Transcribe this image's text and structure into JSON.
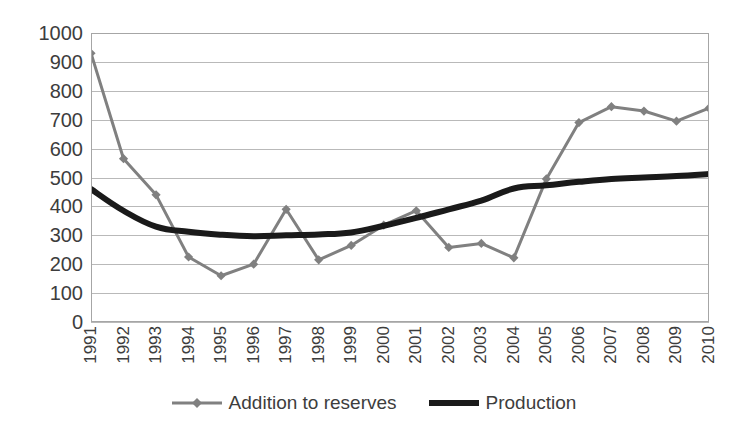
{
  "chart_data": {
    "type": "line",
    "title": "",
    "xlabel": "",
    "ylabel": "",
    "ylim": [
      0,
      1000
    ],
    "ytick_step": 100,
    "grid": "horizontal",
    "legend_position": "bottom-center",
    "categories": [
      "1991",
      "1992",
      "1993",
      "1994",
      "1995",
      "1996",
      "1997",
      "1998",
      "1999",
      "2000",
      "2001",
      "2002",
      "2003",
      "2004",
      "2005",
      "2006",
      "2007",
      "2008",
      "2009",
      "2010"
    ],
    "ytick_labels": [
      "1000",
      "900",
      "800",
      "700",
      "600",
      "500",
      "400",
      "300",
      "200",
      "100",
      "0"
    ],
    "series": [
      {
        "name": "Addition to reserves",
        "color": "#808080",
        "marker": "diamond",
        "line_width": 3,
        "values": [
          930,
          565,
          440,
          225,
          160,
          200,
          390,
          215,
          265,
          335,
          385,
          258,
          272,
          222,
          495,
          690,
          745,
          730,
          695,
          740
        ]
      },
      {
        "name": "Production",
        "color": "#1a1a1a",
        "marker": "none",
        "line_width": 6,
        "smooth": true,
        "values": [
          460,
          385,
          330,
          312,
          302,
          297,
          300,
          303,
          310,
          333,
          360,
          390,
          420,
          462,
          473,
          485,
          495,
          500,
          505,
          512
        ]
      }
    ]
  },
  "axis": {
    "y_min": 0,
    "y_max": 1000
  },
  "colors": {
    "series_addition": "#808080",
    "series_production": "#1a1a1a",
    "gridline": "#b9b9b9",
    "plot_border": "#a6a6a6",
    "text": "#3d3d3d",
    "background": "#ffffff"
  }
}
